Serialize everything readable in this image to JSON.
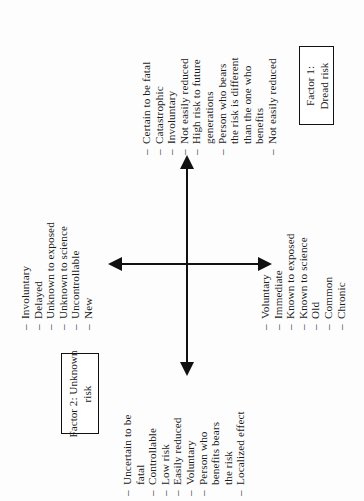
{
  "diagram": {
    "type": "risk-perception-factor-space",
    "axes": {
      "vertical_axis_name": "Factor 1: Dread risk",
      "horizontal_axis_name": "Factor 2: Unknown risk"
    },
    "factor_boxes": [
      {
        "id": "factor-1",
        "line1": "Factor 1:",
        "line2": "Dread risk"
      },
      {
        "id": "factor-2",
        "line1": "Factor 2: Unknown",
        "line2": "risk"
      }
    ],
    "label_groups": {
      "dread_high": {
        "position": "vertical-axis-positive",
        "items": [
          {
            "text": "Certain to be fatal",
            "dash": true
          },
          {
            "text": "Catastrophic",
            "dash": true
          },
          {
            "text": "Involuntary",
            "dash": true
          },
          {
            "text": "Not easily reduced",
            "dash": true
          },
          {
            "text": "High risk to future",
            "dash": true
          },
          {
            "text": "generations",
            "dash": false
          },
          {
            "text": "Person who bears",
            "dash": true
          },
          {
            "text": "the risk is different",
            "dash": false
          },
          {
            "text": "than the one who",
            "dash": false
          },
          {
            "text": "benefits",
            "dash": false
          },
          {
            "text": "Not easily reduced",
            "dash": true
          }
        ]
      },
      "dread_low": {
        "position": "vertical-axis-negative",
        "items": [
          {
            "text": "Uncertain to be",
            "dash": true
          },
          {
            "text": "fatal",
            "dash": false
          },
          {
            "text": "Controllable",
            "dash": true
          },
          {
            "text": "Low risk",
            "dash": true
          },
          {
            "text": "Easily reduced",
            "dash": true
          },
          {
            "text": "Voluntary",
            "dash": true
          },
          {
            "text": "Person who",
            "dash": true
          },
          {
            "text": "benefits bears",
            "dash": false
          },
          {
            "text": "the risk",
            "dash": false
          },
          {
            "text": "Localized effect",
            "dash": true
          }
        ]
      },
      "unknown_high": {
        "position": "horizontal-axis-negative",
        "items": [
          {
            "text": "Involuntary",
            "dash": true
          },
          {
            "text": "Delayed",
            "dash": true
          },
          {
            "text": "Unknown to exposed",
            "dash": true
          },
          {
            "text": "Unknown to science",
            "dash": true
          },
          {
            "text": "Uncontrollable",
            "dash": true
          },
          {
            "text": "New",
            "dash": true
          }
        ]
      },
      "unknown_low": {
        "position": "horizontal-axis-positive",
        "items": [
          {
            "text": "Voluntary",
            "dash": true
          },
          {
            "text": "Immediate",
            "dash": true
          },
          {
            "text": "Known to exposed",
            "dash": true
          },
          {
            "text": "Known to science",
            "dash": true
          },
          {
            "text": "Old",
            "dash": true
          },
          {
            "text": "Common",
            "dash": true
          },
          {
            "text": "Chronic",
            "dash": true
          }
        ]
      }
    },
    "colors": {
      "ink": "#111111",
      "background": "#ffffff"
    }
  }
}
